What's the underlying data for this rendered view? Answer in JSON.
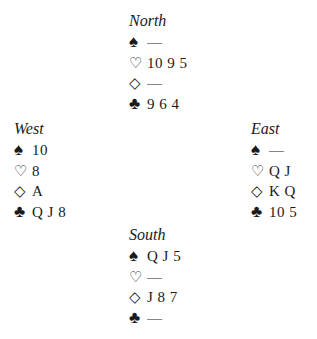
{
  "suit_symbols": {
    "spades": "♠",
    "hearts": "♡",
    "diamonds": "◇",
    "clubs": "♣"
  },
  "hands": {
    "north": {
      "name": "North",
      "spades": "—",
      "hearts": "10 9 5",
      "diamonds": "—",
      "clubs": "9 6 4"
    },
    "west": {
      "name": "West",
      "spades": "10",
      "hearts": "8",
      "diamonds": "A",
      "clubs": "Q J 8"
    },
    "east": {
      "name": "East",
      "spades": "—",
      "hearts": "Q J",
      "diamonds": "K Q",
      "clubs": "10 5"
    },
    "south": {
      "name": "South",
      "spades": "Q J 5",
      "hearts": "—",
      "diamonds": "J 8 7",
      "clubs": "—"
    }
  }
}
